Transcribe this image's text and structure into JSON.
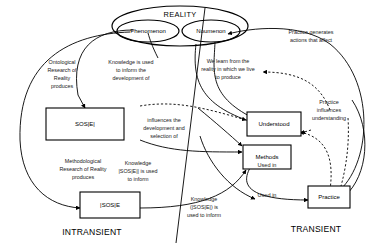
{
  "diagram": {
    "colors": {
      "stroke": "#000000",
      "background": "#ffffff",
      "label_text": "#1a1a1a"
    },
    "nodes": {
      "reality": {
        "label": "REALITY",
        "shape": "ellipse"
      },
      "phenomenon": {
        "label": "Phenomenon",
        "shape": "ellipse"
      },
      "noumenon": {
        "label": "Noumenon",
        "shape": "ellipse"
      },
      "sose_top": {
        "label": "SOS|E|",
        "shape": "box"
      },
      "sose_bottom": {
        "label": "|SOS|E",
        "shape": "box"
      },
      "understood": {
        "label": "Understood",
        "shape": "box"
      },
      "methods": {
        "label": "Methods",
        "shape": "box"
      },
      "practice": {
        "label": "Practice",
        "shape": "box"
      }
    },
    "regions": {
      "intransient": {
        "label": "INTRANSIENT"
      },
      "transient": {
        "label": "TRANSIENT"
      }
    },
    "edge_labels": {
      "ontological": {
        "lines": [
          "Ontological",
          "Research of",
          "Reality",
          "produces"
        ]
      },
      "knowledge_informs_development": {
        "lines": [
          "Knowledge is used",
          "to inform the",
          "development of"
        ]
      },
      "we_learn": {
        "lines": [
          "We learn from the",
          "reality in which we live",
          "to produce"
        ]
      },
      "practice_generates": {
        "lines": [
          "Practice generates",
          "actions that affect"
        ]
      },
      "practice_influences": {
        "lines": [
          "Practice",
          "influences",
          "understanding"
        ]
      },
      "influences_development": {
        "lines": [
          "influences the",
          "development and",
          "selection of"
        ]
      },
      "methodological": {
        "lines": [
          "Methodological",
          "Research of Reality",
          "produces"
        ]
      },
      "knowledge_sose_informs": {
        "lines": [
          "Knowledge",
          "|SOS|E|| is used",
          "to inform"
        ]
      },
      "knowledge_sose_bottom_informs": {
        "lines": [
          "Knowledge",
          "(|SOS|E|) is",
          "used to inform"
        ]
      },
      "used_in_methods": {
        "lines": [
          "Used in"
        ]
      },
      "used_in_understood": {
        "lines": [
          "Used in"
        ]
      }
    }
  }
}
